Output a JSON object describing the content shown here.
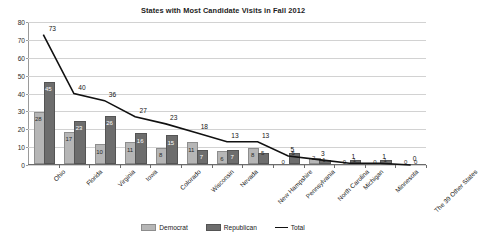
{
  "chart_data": {
    "type": "bar",
    "title": "States with Most Candidate Visits in Fall 2012",
    "xlabel": "",
    "ylabel": "",
    "ylim": [
      0,
      80
    ],
    "ytick_step": 10,
    "grid": true,
    "legend_position": "bottom",
    "categories": [
      "Ohio",
      "Florida",
      "Virginia",
      "Iowa",
      "Colorado",
      "Wisconsin",
      "Nevada",
      "New Hampshire",
      "Pennsylvania",
      "North Carolina",
      "Michigan",
      "Minnesota",
      "The 39 Other States"
    ],
    "yticks": [
      "0",
      "10",
      "20",
      "30",
      "40",
      "50",
      "60",
      "70",
      "80"
    ],
    "series": [
      {
        "name": "Democrat",
        "kind": "bar",
        "color": "#b6b6b6",
        "values": [
          28,
          17,
          10,
          11,
          8,
          11,
          6,
          8,
          0,
          2,
          0,
          0,
          0
        ]
      },
      {
        "name": "Republican",
        "kind": "bar",
        "color": "#6d6d6d",
        "values": [
          45,
          23,
          26,
          16,
          15,
          7,
          7,
          5,
          5,
          1,
          1,
          1,
          0
        ]
      },
      {
        "name": "Total",
        "kind": "line",
        "color": "#111111",
        "values": [
          73,
          40,
          36,
          27,
          23,
          18,
          13,
          13,
          5,
          3,
          1,
          1,
          0
        ]
      }
    ]
  },
  "legend": {
    "items": [
      {
        "label": "Democrat",
        "swatch": "dem"
      },
      {
        "label": "Republican",
        "swatch": "rep"
      },
      {
        "label": "Total",
        "swatch": "line"
      }
    ]
  }
}
